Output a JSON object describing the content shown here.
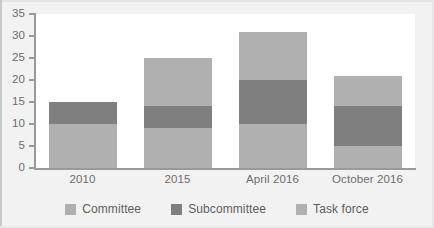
{
  "chart_data": {
    "type": "bar",
    "stacked": true,
    "title": "",
    "subtitle": "",
    "xlabel": "",
    "ylabel": "",
    "ylim": [
      0,
      35
    ],
    "ytick_interval": 5,
    "yticks": [
      "35",
      "30",
      "25",
      "20",
      "15",
      "10",
      "5",
      "0"
    ],
    "grid": false,
    "legend_position": "bottom",
    "categories": [
      "2010",
      "2015",
      "April 2016",
      "October 2016"
    ],
    "series": [
      {
        "name": "Committee",
        "color": "#b0b0b0",
        "values": [
          10,
          9,
          10,
          5
        ]
      },
      {
        "name": "Subcommittee",
        "color": "#7f7f7f",
        "values": [
          5,
          5,
          10,
          9
        ]
      },
      {
        "name": "Task force",
        "color": "#b0b0b0",
        "values": [
          0,
          11,
          11,
          7
        ]
      }
    ],
    "totals": [
      15,
      25,
      31,
      21
    ]
  },
  "legend": {
    "items": [
      {
        "label": "Committee"
      },
      {
        "label": "Subcommittee"
      },
      {
        "label": "Task force"
      }
    ]
  },
  "colors": {
    "plot_background": "#ffffff",
    "frame_background": "#f2f2f2",
    "axis": "#9a9a9a",
    "tick_text": "#6d6d6d",
    "legend_text": "#5f5f5f"
  }
}
